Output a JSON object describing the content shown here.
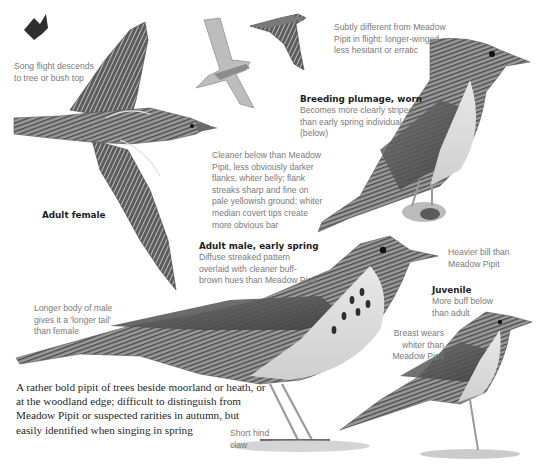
{
  "plate": {
    "subject": "Tree Pipit identification plate",
    "palette": {
      "background": "#ffffff",
      "heading": "#1e1e1e",
      "caption": "#7a7a7a",
      "plumage_dark": "#3a3a3a",
      "plumage_mid": "#8a8a8a",
      "plumage_light": "#d8d8d8"
    }
  },
  "annotations": {
    "song_flight": {
      "text": "Song flight descends to tree or bush top"
    },
    "flight_difference": {
      "text": "Subtly different from Meadow Pipit in flight: longer-winged, less hesitant or erratic"
    },
    "breeding_plumage": {
      "title": "Breeding plumage, worn",
      "text": "Becomes more clearly striped than early spring individual (below)"
    },
    "underparts": {
      "text": "Cleaner below than Meadow Pipit, less obviously darker flanks, whiter belly; flank streaks sharp and fine on pale yellowish ground; whiter median covert tips create more obvious bar"
    },
    "adult_female": {
      "title": "Adult female"
    },
    "adult_male": {
      "title": "Adult male, early spring",
      "text": "Diffuse streaked pattern overlaid with cleaner buff-brown hues than Meadow Pipit"
    },
    "bill": {
      "text": "Heavier bill than Meadow Pipit"
    },
    "juvenile": {
      "title": "Juvenile",
      "text": "More buff below than adult"
    },
    "body_length": {
      "text": "Longer body of male gives it a 'longer tail' than female"
    },
    "breast": {
      "text": "Breast wears whiter than Meadow Pipit"
    },
    "hind_claw": {
      "text": "Short hind claw"
    }
  },
  "intro": {
    "text": "A rather bold pipit of trees beside moorland or heath, or at the woodland edge; difficult to distinguish from Meadow Pipit or suspected rarities in autumn, but easily identified when singing in spring"
  }
}
